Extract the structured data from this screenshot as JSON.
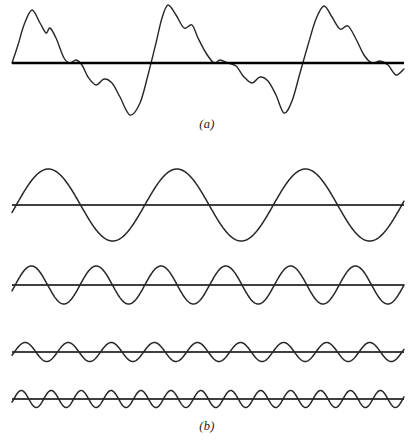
{
  "figure": {
    "kind": "fourier-synthesis-diagram",
    "stroke_color": "#262626",
    "axis_color": "#000000",
    "background_color": "#ffffff"
  },
  "panel_a": {
    "caption": "(a)",
    "label_name": "composite-waveform",
    "axis": {
      "y": 63,
      "x_start": 12,
      "x_end": 404,
      "thickness": 2.6
    },
    "stroke_width": 1.4
  },
  "panel_b": {
    "caption": "(b)",
    "label_name": "harmonic-components",
    "stroke_width": 1.5,
    "waves": [
      {
        "name": "harmonic-1-fundamental",
        "baseline_y": 205,
        "amplitude": 36,
        "cycles": 3.05,
        "phase_deg": 12,
        "x_start": 12,
        "x_end": 404,
        "axis_thickness": 1.4
      },
      {
        "name": "harmonic-2",
        "baseline_y": 285,
        "amplitude": 19,
        "cycles": 6.05,
        "phase_deg": 18,
        "x_start": 12,
        "x_end": 404,
        "axis_thickness": 1.4
      },
      {
        "name": "harmonic-3",
        "baseline_y": 352,
        "amplitude": 9.5,
        "cycles": 9.1,
        "phase_deg": 20,
        "x_start": 12,
        "x_end": 404,
        "axis_thickness": 1.4
      },
      {
        "name": "harmonic-4",
        "baseline_y": 399,
        "amplitude": 8.5,
        "cycles": 13.1,
        "phase_deg": 22,
        "x_start": 12,
        "x_end": 404,
        "axis_thickness": 1.4
      }
    ]
  },
  "chart_data": {
    "type": "line",
    "title": "",
    "xlabel": "",
    "ylabel": "",
    "grid": false,
    "legend": "none",
    "panels": [
      {
        "id": "a",
        "caption": "(a)",
        "type": "line",
        "series": [
          {
            "name": "composite-signal",
            "comment": "Sum of the four harmonics in panel (b); values are display units relative to the zero axis, positive upward.",
            "x": [
              12,
              18,
              24,
              32,
              40,
              46,
              50,
              56,
              64,
              70,
              76,
              82,
              88,
              96,
              104,
              112,
              120,
              130,
              140,
              148,
              156,
              162,
              168,
              176,
              184,
              192,
              198,
              206,
              214,
              220,
              228,
              236,
              244,
              252,
              260,
              268,
              276,
              284,
              292,
              300,
              308,
              316,
              324,
              332,
              340,
              348,
              356,
              364,
              372,
              380,
              388,
              396,
              404
            ],
            "y": [
              0,
              18,
              38,
              53,
              40,
              30,
              35,
              25,
              5,
              0,
              3,
              -2,
              -14,
              -22,
              -16,
              -20,
              -34,
              -52,
              -40,
              -12,
              20,
              45,
              58,
              48,
              35,
              38,
              25,
              10,
              0,
              3,
              0,
              -3,
              -14,
              -20,
              -14,
              -18,
              -32,
              -50,
              -38,
              -10,
              18,
              44,
              57,
              46,
              34,
              37,
              24,
              8,
              0,
              2,
              -2,
              -12,
              -6
            ]
          }
        ],
        "axis_y_value": 0
      },
      {
        "id": "b",
        "caption": "(b)",
        "type": "line",
        "series": [
          {
            "name": "harmonic-1-fundamental",
            "cycles": 3,
            "amplitude": 36,
            "phase_deg": 12
          },
          {
            "name": "harmonic-2",
            "cycles": 6,
            "amplitude": 19,
            "phase_deg": 18
          },
          {
            "name": "harmonic-3",
            "cycles": 9,
            "amplitude": 9.5,
            "phase_deg": 20
          },
          {
            "name": "harmonic-4",
            "cycles": 13,
            "amplitude": 8.5,
            "phase_deg": 22
          }
        ]
      }
    ]
  }
}
